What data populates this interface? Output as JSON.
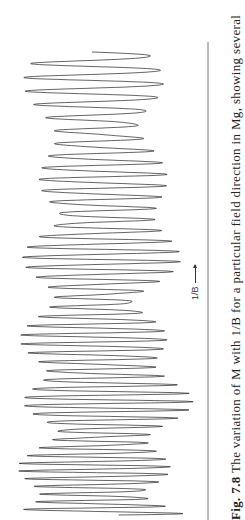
{
  "figure": {
    "number_label": "Fig. 7.8",
    "caption_text": "The variation of M with 1/B for a particular field direction in Mg, showing several",
    "orientation": "rotated 90° counter-clockwise"
  },
  "chart_data": {
    "type": "line",
    "title": "",
    "xlabel": "1/B",
    "ylabel": "M",
    "x_direction": "increasing upward (page rotated)",
    "grid": false,
    "legend": null,
    "axis_line": {
      "x_px": 208,
      "y_start_px": 42,
      "y_end_px": 520
    },
    "series": [
      {
        "name": "M",
        "approx_cycles": 62,
        "amplitude_px_range": [
          40,
          90
        ],
        "center_px": 100
      }
    ]
  },
  "colors": {
    "line": "#222222",
    "axis": "#555555",
    "text": "#222222",
    "background": "#ffffff"
  }
}
